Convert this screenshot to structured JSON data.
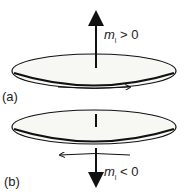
{
  "panels": [
    {
      "label": "(a)",
      "moment_symbol": "m",
      "moment_subscript": "l",
      "moment_relation": " > 0",
      "arrow_direction": "up",
      "circulation": "counterclockwise (arrow pointing right on front)"
    },
    {
      "label": "(b)",
      "moment_symbol": "m",
      "moment_subscript": "l",
      "moment_relation": " < 0",
      "arrow_direction": "down",
      "circulation": "clockwise (arrow pointing left on front)"
    }
  ],
  "colors": {
    "line": "#111111",
    "disk_fill": "#f7f7f4"
  }
}
